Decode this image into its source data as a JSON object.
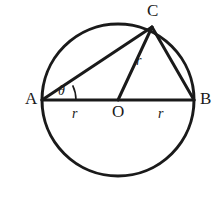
{
  "figure": {
    "name": "circle-with-inscribed-triangle",
    "background_color": "#ffffff",
    "stroke_color": "#1a1a1a",
    "circle": {
      "center_x": 118,
      "center_y": 100,
      "radius": 76,
      "stroke_width": 3
    },
    "points": {
      "A": {
        "x": 42,
        "y": 100,
        "label": "A",
        "label_x": 25,
        "label_y": 104
      },
      "B": {
        "x": 194,
        "y": 100,
        "label": "B",
        "label_x": 200,
        "label_y": 104
      },
      "C": {
        "x": 152,
        "y": 27,
        "label": "C",
        "label_x": 147,
        "label_y": 16
      },
      "O": {
        "x": 118,
        "y": 100,
        "label": "O",
        "label_x": 112,
        "label_y": 117
      }
    },
    "segments": [
      {
        "name": "segment-AB",
        "from": "A",
        "to": "B",
        "stroke_width": 3
      },
      {
        "name": "segment-AC",
        "from": "A",
        "to": "C",
        "stroke_width": 3
      },
      {
        "name": "segment-CB",
        "from": "C",
        "to": "B",
        "stroke_width": 3
      },
      {
        "name": "segment-OC",
        "from": "O",
        "to": "C",
        "stroke_width": 3
      }
    ],
    "length_labels": [
      {
        "name": "radius-label-AO",
        "text": "r",
        "x": 72,
        "y": 118
      },
      {
        "name": "radius-label-OB",
        "text": "r",
        "x": 158,
        "y": 118
      },
      {
        "name": "radius-label-OC",
        "text": "r",
        "x": 136,
        "y": 65
      }
    ],
    "angle": {
      "name": "angle-theta-at-A",
      "symbol": "θ",
      "label_x": 58,
      "label_y": 95,
      "arc_center_x": 42,
      "arc_center_y": 100,
      "arc_radius": 34,
      "arc_start_deg": 0,
      "arc_end_deg": 25.6,
      "stroke_width": 1.6
    }
  }
}
